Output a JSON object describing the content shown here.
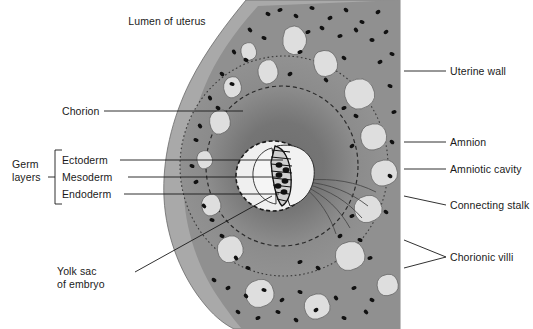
{
  "figure": {
    "type": "anatomical-diagram",
    "background_color": "#ffffff"
  },
  "colors": {
    "uterine_wall": "#a9a9a9",
    "chorion_band": "#8f8f8f",
    "inner_zone": "#7d7d7d",
    "villi_light": "#dcdcdc",
    "cavity_light": "#efefef",
    "dots": "#111111",
    "leader_line": "#1a1a1a",
    "text": "#1a1a1a"
  },
  "labels": {
    "lumen_of_uterus": "Lumen of uterus",
    "chorion": "Chorion",
    "germ_layers_line1": "Germ",
    "germ_layers_line2": "layers",
    "ectoderm": "Ectoderm",
    "mesoderm": "Mesoderm",
    "endoderm": "Endoderm",
    "yolk_sac_line1": "Yolk sac",
    "yolk_sac_line2": "of embryo",
    "uterine_wall": "Uterine wall",
    "amnion": "Amnion",
    "amniotic_cavity": "Amniotic cavity",
    "connecting_stalk": "Connecting stalk",
    "chorionic_villi": "Chorionic villi"
  },
  "structures": [
    {
      "name": "lumen-of-uterus",
      "label": "Lumen of uterus",
      "side": "top-left"
    },
    {
      "name": "chorion",
      "label": "Chorion",
      "side": "left"
    },
    {
      "name": "ectoderm",
      "label": "Ectoderm",
      "side": "left",
      "group": "Germ layers"
    },
    {
      "name": "mesoderm",
      "label": "Mesoderm",
      "side": "left",
      "group": "Germ layers"
    },
    {
      "name": "endoderm",
      "label": "Endoderm",
      "side": "left",
      "group": "Germ layers"
    },
    {
      "name": "yolk-sac-of-embryo",
      "label": "Yolk sac of embryo",
      "side": "bottom-left"
    },
    {
      "name": "uterine-wall",
      "label": "Uterine wall",
      "side": "right"
    },
    {
      "name": "amnion",
      "label": "Amnion",
      "side": "right"
    },
    {
      "name": "amniotic-cavity",
      "label": "Amniotic cavity",
      "side": "right"
    },
    {
      "name": "connecting-stalk",
      "label": "Connecting stalk",
      "side": "right"
    },
    {
      "name": "chorionic-villi",
      "label": "Chorionic villi",
      "side": "right"
    }
  ]
}
